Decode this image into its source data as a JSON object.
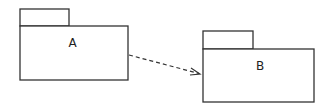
{
  "diagram": {
    "type": "uml-package-dependency",
    "packages": [
      {
        "id": "A",
        "label": "A"
      },
      {
        "id": "B",
        "label": "B"
      }
    ],
    "edges": [
      {
        "from": "A",
        "to": "B",
        "style": "dashed",
        "arrow": "open"
      }
    ],
    "colors": {
      "stroke": "#333333",
      "background": "#ffffff"
    }
  }
}
